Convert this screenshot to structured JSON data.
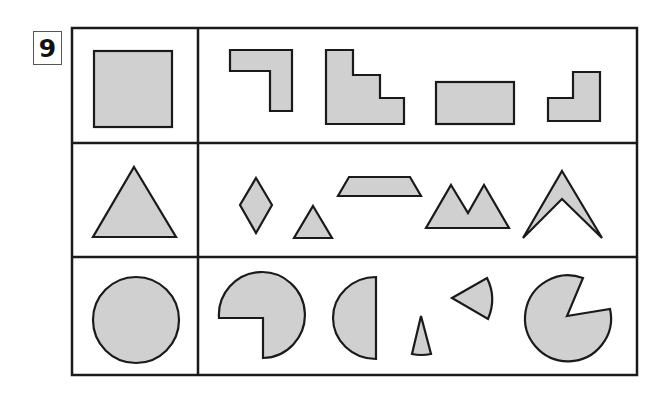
{
  "problem": {
    "number": "9"
  },
  "colors": {
    "shape_fill": "#d0d0d0",
    "stroke": "#1a1a1a",
    "background": "#ffffff"
  },
  "rows": [
    {
      "reference_shape": "square",
      "pieces": [
        "L-shape (inverted, hook right)",
        "staircase",
        "rectangle",
        "small L-shape"
      ]
    },
    {
      "reference_shape": "triangle",
      "pieces": [
        "rhombus",
        "small triangle",
        "trapezoid",
        "double peak (M shape)",
        "chevron/arrowhead"
      ]
    },
    {
      "reference_shape": "circle",
      "pieces": [
        "three-quarter circle",
        "half circle",
        "thin sector",
        "small sector",
        "circle with wedge removed"
      ]
    }
  ]
}
